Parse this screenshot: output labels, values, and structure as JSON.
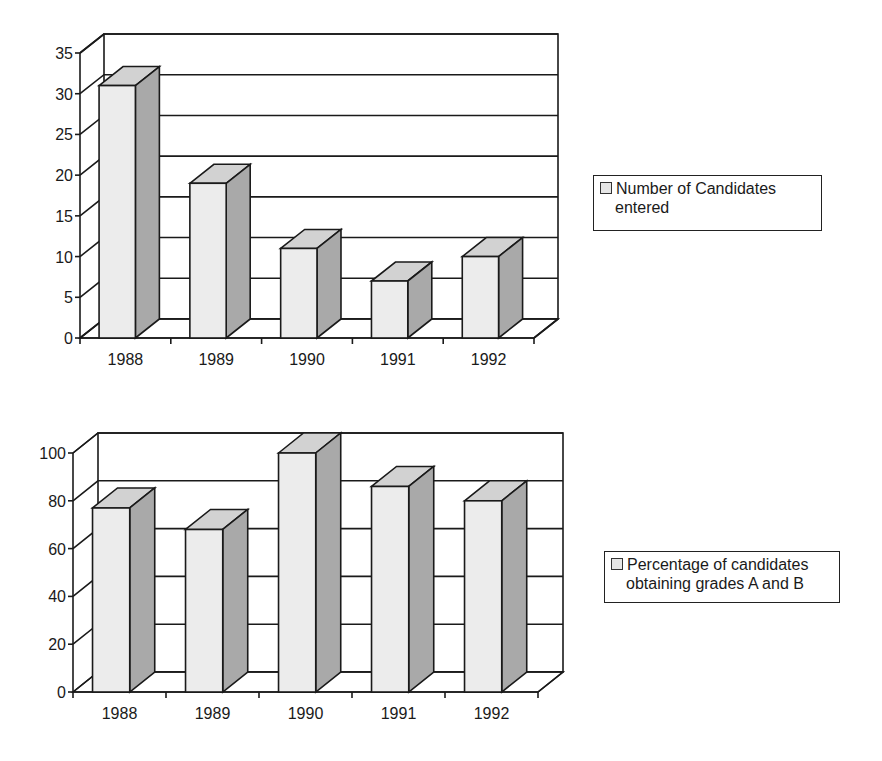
{
  "chart_data": [
    {
      "type": "bar",
      "style": "3d-column",
      "title": "",
      "xlabel": "",
      "ylabel": "",
      "categories": [
        "1988",
        "1989",
        "1990",
        "1991",
        "1992"
      ],
      "series": [
        {
          "name": "Number of Candidates entered",
          "values": [
            31,
            19,
            11,
            7,
            10
          ]
        }
      ],
      "ylim": [
        0,
        35
      ],
      "yticks": [
        0,
        5,
        10,
        15,
        20,
        25,
        30,
        35
      ],
      "grid": true,
      "legend_position": "right"
    },
    {
      "type": "bar",
      "style": "3d-column",
      "title": "",
      "xlabel": "",
      "ylabel": "",
      "categories": [
        "1988",
        "1989",
        "1990",
        "1991",
        "1992"
      ],
      "series": [
        {
          "name": "Percentage of candidates obtaining grades A and B",
          "values": [
            77,
            68,
            100,
            86,
            80
          ]
        }
      ],
      "ylim": [
        0,
        100
      ],
      "yticks": [
        0,
        20,
        40,
        60,
        80,
        100
      ],
      "grid": true,
      "legend_position": "right"
    }
  ],
  "legends": [
    {
      "line1": "Number of Candidates",
      "line2": "entered"
    },
    {
      "line1": "Percentage of candidates",
      "line2": "obtaining grades A and B"
    }
  ],
  "colors": {
    "bar_front": "#ececec",
    "bar_top": "#d2d2d2",
    "bar_side": "#a9a9a9",
    "axis": "#1a1a1a",
    "grid": "#1a1a1a"
  }
}
